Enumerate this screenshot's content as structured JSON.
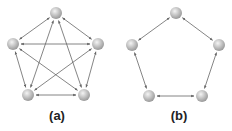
{
  "figure": {
    "panels": [
      {
        "id": "a",
        "label": "(a)",
        "topology": "fully-connected",
        "nodes": [
          [
            56,
            13
          ],
          [
            13,
            44
          ],
          [
            98,
            44
          ],
          [
            28,
            95
          ],
          [
            84,
            95
          ]
        ],
        "edges": [
          [
            0,
            1
          ],
          [
            0,
            2
          ],
          [
            0,
            3
          ],
          [
            0,
            4
          ],
          [
            1,
            2
          ],
          [
            1,
            3
          ],
          [
            1,
            4
          ],
          [
            2,
            3
          ],
          [
            2,
            4
          ],
          [
            3,
            4
          ]
        ]
      },
      {
        "id": "b",
        "label": "(b)",
        "topology": "ring",
        "nodes": [
          [
            176,
            13
          ],
          [
            132,
            45
          ],
          [
            219,
            45
          ],
          [
            149,
            96
          ],
          [
            202,
            96
          ]
        ],
        "edges": [
          [
            0,
            1
          ],
          [
            0,
            2
          ],
          [
            1,
            3
          ],
          [
            2,
            4
          ],
          [
            3,
            4
          ]
        ]
      }
    ],
    "colors": {
      "edge": "#666666",
      "node_light": "#f2f2f2",
      "node_dark": "#9a9a9a",
      "label": "#222222"
    }
  }
}
